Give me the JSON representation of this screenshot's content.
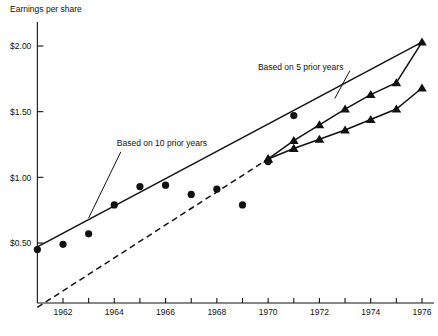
{
  "chart_data": {
    "type": "scatter",
    "title": "",
    "ylabel": "Earnings per share",
    "xlabel": "",
    "xlim": [
      1961,
      1976.6
    ],
    "ylim": [
      0.0,
      2.2
    ],
    "grid": false,
    "legend_position": "inline-annotations",
    "yticks": [
      0.5,
      1.0,
      1.5,
      2.0
    ],
    "ytick_labels": [
      "$0.50",
      "$1.00",
      "$1.50",
      "$2.00"
    ],
    "xticks": [
      1962,
      1963,
      1964,
      1965,
      1966,
      1967,
      1968,
      1969,
      1970,
      1971,
      1972,
      1973,
      1974,
      1975,
      1976
    ],
    "xtick_labels": [
      "1962",
      "",
      "1964",
      "",
      "1966",
      "",
      "1968",
      "",
      "1970",
      "",
      "1972",
      "",
      "1974",
      "",
      "1976"
    ],
    "xtick_labels_shown": [
      "1962",
      "1964",
      "1966",
      "1968",
      "1970",
      "1972",
      "1974",
      "1976"
    ],
    "series": [
      {
        "name": "Actual earnings per share",
        "marker": "circle",
        "line": "none",
        "x": [
          1961,
          1962,
          1963,
          1964,
          1965,
          1966,
          1967,
          1968,
          1969,
          1970,
          1971
        ],
        "values": [
          0.45,
          0.49,
          0.57,
          0.79,
          0.93,
          0.94,
          0.87,
          0.91,
          0.79,
          1.12,
          1.47
        ]
      },
      {
        "name": "Based on 10 prior years",
        "marker": "none",
        "line": "solid",
        "x": [
          1961,
          1976
        ],
        "values": [
          0.47,
          2.03
        ]
      },
      {
        "name": "Based on 5 prior years",
        "marker": "triangle",
        "line": "solid",
        "x": [
          1970,
          1971,
          1972,
          1973,
          1974,
          1975,
          1976
        ],
        "values": [
          1.14,
          1.28,
          1.4,
          1.52,
          1.63,
          1.72,
          2.03
        ]
      },
      {
        "name": "Lower projection",
        "marker": "triangle",
        "line": "solid",
        "x": [
          1970,
          1971,
          1972,
          1973,
          1974,
          1975,
          1976
        ],
        "values": [
          1.14,
          1.22,
          1.29,
          1.36,
          1.44,
          1.52,
          1.68
        ]
      },
      {
        "name": "Historical trend extension",
        "marker": "none",
        "line": "dashed",
        "x": [
          1961,
          1970
        ],
        "values": [
          0.01,
          1.14
        ]
      }
    ],
    "annotations": [
      {
        "text": "Based on 10 prior years",
        "x": 1964.1,
        "y": 1.24,
        "leader_to_x": 1963.0,
        "leader_to_y": 0.69
      },
      {
        "text": "Based on 5 prior years",
        "x": 1969.6,
        "y": 1.82,
        "leader_to_x": 1972.6,
        "leader_to_y": 1.6
      }
    ],
    "colors": {
      "ink": "#111111",
      "background": "#ffffff"
    }
  }
}
